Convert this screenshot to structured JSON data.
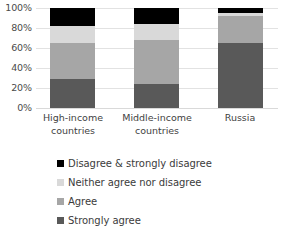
{
  "chart_data": {
    "type": "bar",
    "subtype": "stacked-100-percent",
    "title": "",
    "subtitle": "",
    "xlabel": "",
    "ylabel": "",
    "categories": [
      "High-income countries",
      "Middle-income countries",
      "Russia"
    ],
    "category_lines": [
      [
        "High-income",
        "countries"
      ],
      [
        "Middle-income",
        "countries"
      ],
      [
        "Russia"
      ]
    ],
    "series": [
      {
        "name": "Strongly agree",
        "color": "#595959",
        "values": [
          29,
          24,
          65
        ]
      },
      {
        "name": "Agree",
        "color": "#a6a6a6",
        "values": [
          36,
          44,
          27
        ]
      },
      {
        "name": "Neither agree nor disagree",
        "color": "#d9d9d9",
        "values": [
          17,
          16,
          3
        ]
      },
      {
        "name": "Disagree & strongly disagree",
        "color": "#000000",
        "values": [
          18,
          16,
          5
        ]
      }
    ],
    "ylim": [
      0,
      100
    ],
    "y_ticks": [
      0,
      20,
      40,
      60,
      80,
      100
    ],
    "y_tick_labels": [
      "0%",
      "20%",
      "40%",
      "60%",
      "80%",
      "100%"
    ],
    "grid": true,
    "grid_color": "#e2e2e2",
    "legend_position": "bottom",
    "legend_order": [
      "Disagree & strongly disagree",
      "Neither agree nor disagree",
      "Agree",
      "Strongly agree"
    ],
    "legend_entries": [
      {
        "label": "Disagree & strongly disagree",
        "color": "#000000"
      },
      {
        "label": "Neither agree nor disagree",
        "color": "#d9d9d9"
      },
      {
        "label": "Agree",
        "color": "#a6a6a6"
      },
      {
        "label": "Strongly agree",
        "color": "#595959"
      }
    ]
  },
  "colors": {
    "background": "#ffffff",
    "text": "#3b3b3b",
    "gridline": "#e2e2e2",
    "strongly_agree": "#595959",
    "agree": "#a6a6a6",
    "neither": "#d9d9d9",
    "disagree": "#000000"
  }
}
